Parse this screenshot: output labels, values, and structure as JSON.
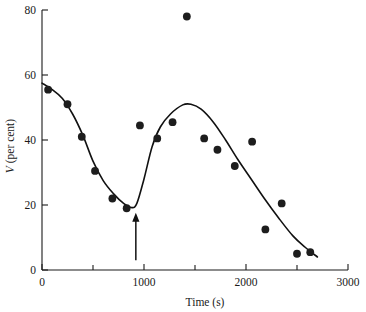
{
  "chart_data": {
    "type": "scatter",
    "title": "",
    "subtitle": "",
    "xlabel": "Time (s)",
    "ylabel": "V (per cent)",
    "ylabel_italic_symbol": "V",
    "ylabel_rest": " (per cent)",
    "xlim": [
      0,
      3000
    ],
    "ylim": [
      0,
      80
    ],
    "grid": false,
    "legend": null,
    "legend_position": "none",
    "x_major_ticks": [
      0,
      1000,
      2000,
      3000
    ],
    "x_minor_ticks": [
      500,
      1500,
      2500
    ],
    "x_tick_labels": [
      "0",
      "1000",
      "2000",
      "3000"
    ],
    "y_major_ticks": [
      0,
      20,
      40,
      60,
      80
    ],
    "y_tick_labels": [
      "0",
      "20",
      "40",
      "60",
      "80"
    ],
    "points": [
      {
        "x": 60,
        "y": 55.5
      },
      {
        "x": 250,
        "y": 51.0
      },
      {
        "x": 390,
        "y": 41.0
      },
      {
        "x": 520,
        "y": 30.5
      },
      {
        "x": 690,
        "y": 22.0
      },
      {
        "x": 830,
        "y": 19.0
      },
      {
        "x": 960,
        "y": 44.5
      },
      {
        "x": 1130,
        "y": 40.5
      },
      {
        "x": 1280,
        "y": 45.5
      },
      {
        "x": 1420,
        "y": 78.0
      },
      {
        "x": 1590,
        "y": 40.5
      },
      {
        "x": 1720,
        "y": 37.0
      },
      {
        "x": 1890,
        "y": 32.0
      },
      {
        "x": 2060,
        "y": 39.5
      },
      {
        "x": 2190,
        "y": 12.5
      },
      {
        "x": 2350,
        "y": 20.5
      },
      {
        "x": 2500,
        "y": 5.0
      },
      {
        "x": 2630,
        "y": 5.5
      }
    ],
    "fitted_curve": [
      {
        "x": 0,
        "y": 57.5
      },
      {
        "x": 100,
        "y": 55.5
      },
      {
        "x": 200,
        "y": 52.8
      },
      {
        "x": 300,
        "y": 48.0
      },
      {
        "x": 400,
        "y": 41.5
      },
      {
        "x": 500,
        "y": 33.5
      },
      {
        "x": 600,
        "y": 27.5
      },
      {
        "x": 700,
        "y": 23.5
      },
      {
        "x": 800,
        "y": 20.5
      },
      {
        "x": 880,
        "y": 19.2
      },
      {
        "x": 930,
        "y": 20.5
      },
      {
        "x": 1000,
        "y": 28.0
      },
      {
        "x": 1080,
        "y": 38.0
      },
      {
        "x": 1160,
        "y": 44.0
      },
      {
        "x": 1260,
        "y": 48.0
      },
      {
        "x": 1380,
        "y": 50.8
      },
      {
        "x": 1460,
        "y": 51.0
      },
      {
        "x": 1560,
        "y": 49.5
      },
      {
        "x": 1680,
        "y": 45.5
      },
      {
        "x": 1800,
        "y": 40.0
      },
      {
        "x": 1920,
        "y": 34.0
      },
      {
        "x": 2050,
        "y": 28.0
      },
      {
        "x": 2180,
        "y": 22.0
      },
      {
        "x": 2320,
        "y": 16.0
      },
      {
        "x": 2460,
        "y": 10.5
      },
      {
        "x": 2580,
        "y": 7.0
      },
      {
        "x": 2700,
        "y": 4.0
      }
    ],
    "annotations": [
      {
        "kind": "arrow",
        "label": "",
        "x": 920,
        "y_tail": 3.0,
        "y_head": 17.0,
        "direction": "up"
      }
    ]
  }
}
